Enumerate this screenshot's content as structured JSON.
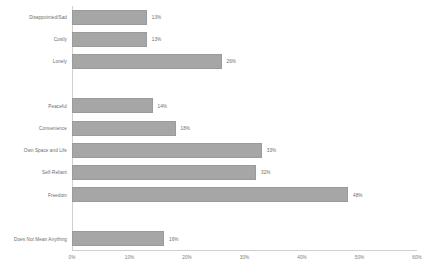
{
  "chart_data": {
    "type": "bar",
    "orientation": "horizontal",
    "title": "",
    "xlabel": "",
    "ylabel": "",
    "xlim": [
      0,
      60
    ],
    "grid": false,
    "legend": null,
    "bar_color": "#a6a6a6",
    "axis_color": "#d0d0d0",
    "text_color": "#6b6b6b",
    "categories": [
      "Disappointed/Sad",
      "Costly",
      "Lonely",
      "Peaceful",
      "Convenience",
      "Own Space and Life",
      "Self-Reliant",
      "Freedom",
      "Does Not Mean Anything"
    ],
    "values": [
      13,
      13,
      26,
      14,
      18,
      33,
      32,
      48,
      16
    ],
    "value_labels": [
      "13%",
      "13%",
      "26%",
      "14%",
      "18%",
      "33%",
      "32%",
      "48%",
      "16%"
    ],
    "row_slots": [
      0,
      1,
      2,
      4,
      5,
      6,
      7,
      8,
      10
    ],
    "total_slots": 11,
    "ticks": [
      0,
      10,
      20,
      30,
      40,
      50,
      60
    ],
    "tick_labels": [
      "0%",
      "10%",
      "20%",
      "30%",
      "40%",
      "50%",
      "60%"
    ]
  }
}
